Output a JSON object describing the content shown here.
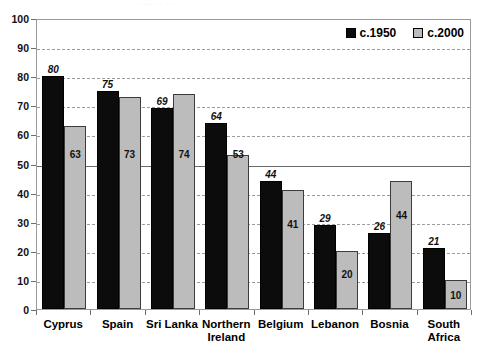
{
  "top_ghost_text": "· ·· ···  ·· ··· ·",
  "chart_data": {
    "type": "bar",
    "title": "",
    "xlabel": "",
    "ylabel": "",
    "ylim": [
      0,
      100
    ],
    "ytick_step": 10,
    "yticks": [
      "100",
      "90",
      "80",
      "70",
      "60",
      "50",
      "40",
      "30",
      "20",
      "10",
      "0"
    ],
    "grid": true,
    "grid_major_value": 50,
    "legend_position": "top-right",
    "categories": [
      "Cyprus",
      "Spain",
      "Sri Lanka",
      "Northern Ireland",
      "Belgium",
      "Lebanon",
      "Bosnia",
      "South Africa"
    ],
    "series": [
      {
        "name": "c.1950",
        "color": "#0c0c0c",
        "values": [
          80,
          75,
          69,
          64,
          44,
          29,
          26,
          21
        ]
      },
      {
        "name": "c.2000",
        "color": "#bcbcbc",
        "values": [
          63,
          73,
          74,
          53,
          41,
          20,
          44,
          10
        ]
      }
    ]
  },
  "legend": {
    "entries": [
      {
        "label": "c.1950",
        "color": "#0c0c0c"
      },
      {
        "label": "c.2000",
        "color": "#bcbcbc"
      }
    ]
  },
  "axis": {
    "y_labels": [
      "100",
      "90",
      "80",
      "70",
      "60",
      "50",
      "40",
      "30",
      "20",
      "10",
      "0"
    ],
    "x_labels": [
      {
        "line1": "Cyprus",
        "line2": ""
      },
      {
        "line1": "Spain",
        "line2": ""
      },
      {
        "line1": "Sri Lanka",
        "line2": ""
      },
      {
        "line1": "Northern",
        "line2": "Ireland"
      },
      {
        "line1": "Belgium",
        "line2": ""
      },
      {
        "line1": "Lebanon",
        "line2": ""
      },
      {
        "line1": "Bosnia",
        "line2": ""
      },
      {
        "line1": "South",
        "line2": "Africa"
      }
    ]
  },
  "bar_labels": {
    "series_1950": [
      "80",
      "75",
      "69",
      "64",
      "44",
      "29",
      "26",
      "21"
    ],
    "series_2000": [
      "63",
      "73",
      "74",
      "53",
      "41",
      "20",
      "44",
      "10"
    ]
  }
}
